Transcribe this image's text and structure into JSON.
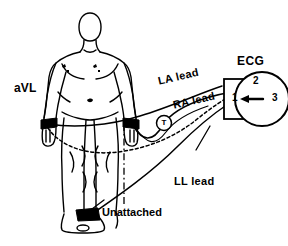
{
  "diagram": {
    "title_label": "ECG",
    "subject": {
      "name_label": "aVL",
      "electrodes": [
        {
          "id": "left-wrist",
          "label": "LA electrode",
          "attached": true
        },
        {
          "id": "right-wrist",
          "label": "RA electrode",
          "attached": true
        },
        {
          "id": "left-ankle",
          "label": "LL electrode",
          "attached": true
        }
      ]
    },
    "leads": [
      {
        "id": "la",
        "label": "LA lead",
        "style": "dashed"
      },
      {
        "id": "ra",
        "label": "RA lead",
        "style": "solid"
      },
      {
        "id": "ll",
        "label": "LL lead",
        "style": "solid"
      }
    ],
    "annotations": {
      "unattached_label": "Unattached",
      "junction_marker": "T"
    },
    "selector": {
      "positions": [
        "1",
        "2",
        "3"
      ],
      "selected": "1",
      "pointer": "left-arrow"
    },
    "colors": {
      "ink": "#000000",
      "paper": "#ffffff"
    }
  }
}
